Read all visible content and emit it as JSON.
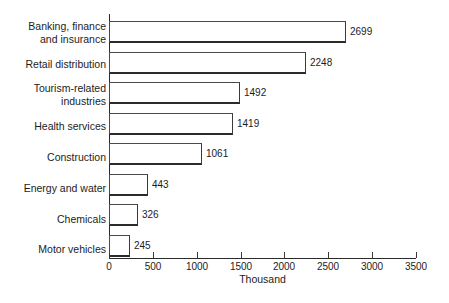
{
  "chart_data": {
    "type": "bar",
    "orientation": "horizontal",
    "title": "",
    "subtitle": "",
    "xlabel": "Thousand",
    "ylabel": "",
    "categories": [
      "Banking, finance\nand insurance",
      "Retail distribution",
      "Tourism-related\nindustries",
      "Health services",
      "Construction",
      "Energy and water",
      "Chemicals",
      "Motor vehicles"
    ],
    "values": [
      2699,
      2248,
      1492,
      1419,
      1061,
      443,
      326,
      245
    ],
    "value_labels": [
      "2699",
      "2248",
      "1492",
      "1419",
      "1061",
      "443",
      "326",
      "245"
    ],
    "xlim": [
      0,
      3500
    ],
    "xticks": [
      0,
      500,
      1000,
      1500,
      2000,
      2500,
      3000,
      3500
    ],
    "xtick_labels": [
      "0",
      "500",
      "1000",
      "1500",
      "2000",
      "2500",
      "3000",
      "3500"
    ],
    "grid": false,
    "legend": false,
    "bar_fill_color": "#ffffff",
    "bar_edge_color": "#3a3a3a",
    "axis_color": "#2a2a2a",
    "text_color": "#1c1c1c",
    "background_color": "#ffffff"
  }
}
